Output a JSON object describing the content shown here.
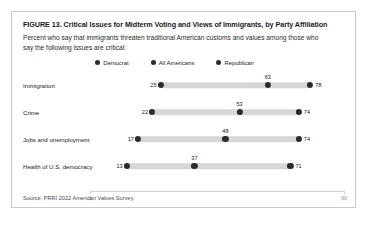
{
  "figure": {
    "title": "FIGURE 13.  Critical Issues for Midterm Voting and Views of Immigrants, by Party Affiliation",
    "subtitle": "Percent who say that immigrants threaten traditional American customs and values among those who say the following issues are critical:",
    "source": "Source: PRRI 2022 American Values Survey."
  },
  "legend": [
    {
      "label": "Democrat",
      "color": "#2b2b2b"
    },
    {
      "label": "All Americans",
      "color": "#2b2b2b"
    },
    {
      "label": "Republican",
      "color": "#2b2b2b"
    }
  ],
  "axis": {
    "min": 0,
    "max": 90,
    "ticks": [
      {
        "value": 0,
        "label": "0"
      },
      {
        "value": 90,
        "label": "90"
      }
    ]
  },
  "chart_data": {
    "type": "bar",
    "subtype": "dumbbell-range",
    "title": "FIGURE 13.  Critical Issues for Midterm Voting and Views of Immigrants, by Party Affiliation",
    "subtitle": "Percent who say that immigrants threaten traditional American customs and values among those who say the following issues are critical:",
    "xlabel": "",
    "ylabel": "",
    "xlim": [
      0,
      90
    ],
    "grid": false,
    "legend_position": "top-center",
    "categories": [
      "Immigration",
      "Crime",
      "Jobs and unemployment",
      "Health of U.S. democracy"
    ],
    "series": [
      {
        "name": "Democrat",
        "values": [
          25,
          22,
          17,
          13
        ]
      },
      {
        "name": "All Americans",
        "values": [
          63,
          53,
          48,
          37
        ]
      },
      {
        "name": "Republican",
        "values": [
          78,
          74,
          74,
          71
        ]
      }
    ],
    "rows": [
      {
        "category": "Immigration",
        "democrat": 25,
        "all_americans": 63,
        "republican": 78
      },
      {
        "category": "Crime",
        "democrat": 22,
        "all_americans": 53,
        "republican": 74
      },
      {
        "category": "Jobs and unemployment",
        "democrat": 17,
        "all_americans": 48,
        "republican": 74
      },
      {
        "category": "Health of U.S. democracy",
        "democrat": 13,
        "all_americans": 37,
        "republican": 71
      }
    ],
    "source": "Source: PRRI 2022 American Values Survey."
  },
  "colors": {
    "dot": "#2b2b2b",
    "bar": "#d6d6d6",
    "axis": "#d0d0d0",
    "card_border": "#c9c9c9"
  }
}
